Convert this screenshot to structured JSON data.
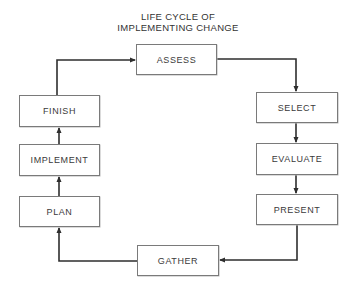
{
  "diagram": {
    "title_line1": "LIFE CYCLE OF",
    "title_line2": "IMPLEMENTING CHANGE",
    "type": "cycle-flowchart",
    "line_color": "#2e2e2e",
    "box_border_color": "#7a7a7a",
    "nodes": [
      {
        "id": "assess",
        "label": "ASSESS"
      },
      {
        "id": "select",
        "label": "SELECT"
      },
      {
        "id": "evaluate",
        "label": "EVALUATE"
      },
      {
        "id": "present",
        "label": "PRESENT"
      },
      {
        "id": "gather",
        "label": "GATHER"
      },
      {
        "id": "plan",
        "label": "PLAN"
      },
      {
        "id": "implement",
        "label": "IMPLEMENT"
      },
      {
        "id": "finish",
        "label": "FINISH"
      }
    ],
    "edges": [
      {
        "from": "ASSESS",
        "to": "SELECT"
      },
      {
        "from": "SELECT",
        "to": "EVALUATE"
      },
      {
        "from": "EVALUATE",
        "to": "PRESENT"
      },
      {
        "from": "PRESENT",
        "to": "GATHER"
      },
      {
        "from": "GATHER",
        "to": "PLAN"
      },
      {
        "from": "PLAN",
        "to": "IMPLEMENT"
      },
      {
        "from": "IMPLEMENT",
        "to": "FINISH"
      },
      {
        "from": "FINISH",
        "to": "ASSESS"
      }
    ]
  }
}
